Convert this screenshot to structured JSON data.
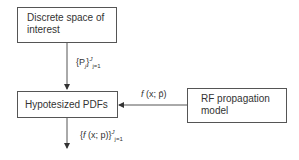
{
  "nodes": {
    "discrete_space": {
      "line1": "Discrete space of",
      "line2": "interest"
    },
    "hypothesized_pdfs": {
      "label": "Hypotesized PDFs"
    },
    "rf_model": {
      "line1": "RF propagation",
      "line2": "model"
    }
  },
  "edges": {
    "space_to_pdfs": {
      "open": "{P",
      "sub_i": "j",
      "close": "}",
      "sup": "J",
      "sub": "j=1"
    },
    "model_to_pdfs": {
      "f": "f",
      "args": " (x; p̄)"
    },
    "pdfs_out": {
      "open": "{",
      "f": "f",
      "args": " (x; p)}",
      "sup": "J",
      "sub": "j=1"
    }
  }
}
